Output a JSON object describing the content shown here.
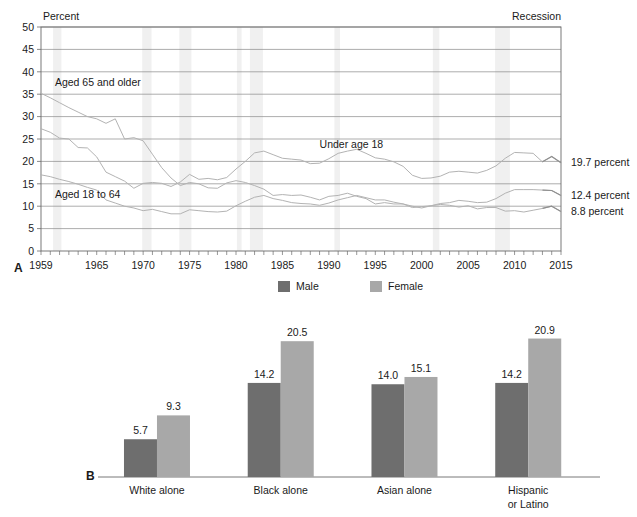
{
  "figure": {
    "panel_a_label": "A",
    "panel_b_label": "B"
  },
  "chart_data": [
    {
      "id": "panel_a",
      "type": "line",
      "title": "",
      "ylabel": "Percent",
      "xlabel": "",
      "ylim": [
        0,
        50
      ],
      "ytick_step": 5,
      "yticks": [
        "0",
        "5",
        "10",
        "15",
        "20",
        "25",
        "30",
        "35",
        "40",
        "45",
        "50"
      ],
      "xlim": [
        1959,
        2015
      ],
      "xticks": [
        "1959",
        "1965",
        "1970",
        "1975",
        "1980",
        "1985",
        "1990",
        "1995",
        "2000",
        "2005",
        "2010",
        "2015"
      ],
      "xtick_values": [
        1959,
        1965,
        1970,
        1975,
        1980,
        1985,
        1990,
        1995,
        2000,
        2005,
        2010,
        2015
      ],
      "grid": true,
      "legend_position": "inline-annotation",
      "recession_legend_label": "Recession",
      "recession_bands": [
        [
          1960.3,
          1961.2
        ],
        [
          1969.9,
          1970.9
        ],
        [
          1973.9,
          1975.2
        ],
        [
          1980.1,
          1980.6
        ],
        [
          1981.5,
          1982.9
        ],
        [
          1990.6,
          1991.2
        ],
        [
          2001.2,
          2001.9
        ],
        [
          2007.9,
          2009.5
        ]
      ],
      "annotations": [
        {
          "text": "Aged 65 and older",
          "x": 1960.5,
          "y": 36.8
        },
        {
          "text": "Under age 18",
          "x": 1989.0,
          "y": 23.0
        },
        {
          "text": "Aged 18 to 64",
          "x": 1960.5,
          "y": 11.8
        }
      ],
      "end_labels": [
        {
          "text": "19.7 percent",
          "value": 19.7
        },
        {
          "text": "12.4 percent",
          "value": 12.4
        },
        {
          "text": "8.8 percent",
          "value": 8.8
        }
      ],
      "series": [
        {
          "name": "Aged 65 and older",
          "end_value": 8.8,
          "x": [
            1959,
            1960,
            1961,
            1962,
            1963,
            1964,
            1965,
            1966,
            1967,
            1968,
            1969,
            1970,
            1971,
            1972,
            1973,
            1974,
            1975,
            1976,
            1977,
            1978,
            1979,
            1980,
            1981,
            1982,
            1983,
            1984,
            1985,
            1986,
            1987,
            1988,
            1989,
            1990,
            1991,
            1992,
            1993,
            1994,
            1995,
            1996,
            1997,
            1998,
            1999,
            2000,
            2001,
            2002,
            2003,
            2004,
            2005,
            2006,
            2007,
            2008,
            2009,
            2010,
            2011,
            2012,
            2013,
            2014,
            2015
          ],
          "values": [
            35.2,
            34.2,
            33.1,
            32.0,
            31.0,
            30.0,
            29.5,
            28.5,
            29.5,
            25.0,
            25.3,
            24.6,
            21.6,
            18.6,
            16.3,
            14.6,
            15.3,
            15.0,
            14.1,
            14.0,
            15.2,
            15.7,
            15.3,
            14.6,
            13.8,
            12.4,
            12.6,
            12.4,
            12.5,
            12.0,
            11.4,
            12.2,
            12.4,
            12.9,
            12.2,
            11.7,
            10.5,
            10.8,
            10.5,
            10.5,
            9.7,
            9.9,
            10.1,
            10.4,
            10.2,
            9.8,
            10.1,
            9.4,
            9.7,
            9.7,
            8.9,
            9.0,
            8.7,
            9.1,
            9.5,
            10.0,
            8.8
          ]
        },
        {
          "name": "Aged 18 to 64",
          "end_value": 12.4,
          "x": [
            1959,
            1960,
            1961,
            1962,
            1963,
            1964,
            1965,
            1966,
            1967,
            1968,
            1969,
            1970,
            1971,
            1972,
            1973,
            1974,
            1975,
            1976,
            1977,
            1978,
            1979,
            1980,
            1981,
            1982,
            1983,
            1984,
            1985,
            1986,
            1987,
            1988,
            1989,
            1990,
            1991,
            1992,
            1993,
            1994,
            1995,
            1996,
            1997,
            1998,
            1999,
            2000,
            2001,
            2002,
            2003,
            2004,
            2005,
            2006,
            2007,
            2008,
            2009,
            2010,
            2011,
            2012,
            2013,
            2014,
            2015
          ],
          "values": [
            17.0,
            16.6,
            16.0,
            15.5,
            14.9,
            14.2,
            13.6,
            11.4,
            10.7,
            10.0,
            9.6,
            9.0,
            9.3,
            8.8,
            8.3,
            8.3,
            9.2,
            9.0,
            8.8,
            8.7,
            8.9,
            10.1,
            11.1,
            12.0,
            12.4,
            11.7,
            11.3,
            10.8,
            10.6,
            10.5,
            10.2,
            10.7,
            11.4,
            11.9,
            12.4,
            11.9,
            11.4,
            11.4,
            10.9,
            10.5,
            10.0,
            9.6,
            10.1,
            10.6,
            10.8,
            11.3,
            11.1,
            10.8,
            10.9,
            11.7,
            12.9,
            13.7,
            13.7,
            13.7,
            13.6,
            13.5,
            12.4
          ]
        },
        {
          "name": "Under age 18",
          "end_value": 19.7,
          "x": [
            1959,
            1960,
            1961,
            1962,
            1963,
            1964,
            1965,
            1966,
            1967,
            1968,
            1969,
            1970,
            1971,
            1972,
            1973,
            1974,
            1975,
            1976,
            1977,
            1978,
            1979,
            1980,
            1981,
            1982,
            1983,
            1984,
            1985,
            1986,
            1987,
            1988,
            1989,
            1990,
            1991,
            1992,
            1993,
            1994,
            1995,
            1996,
            1997,
            1998,
            1999,
            2000,
            2001,
            2002,
            2003,
            2004,
            2005,
            2006,
            2007,
            2008,
            2009,
            2010,
            2011,
            2012,
            2013,
            2014,
            2015
          ],
          "values": [
            27.3,
            26.5,
            25.2,
            25.0,
            23.1,
            23.0,
            21.0,
            17.6,
            16.6,
            15.6,
            14.0,
            15.1,
            15.3,
            15.1,
            14.4,
            15.4,
            17.1,
            16.0,
            16.2,
            15.9,
            16.4,
            18.3,
            20.0,
            21.9,
            22.3,
            21.5,
            20.7,
            20.5,
            20.3,
            19.5,
            19.6,
            20.6,
            21.8,
            22.3,
            22.7,
            21.8,
            20.8,
            20.5,
            19.9,
            18.9,
            16.9,
            16.2,
            16.3,
            16.7,
            17.6,
            17.8,
            17.6,
            17.4,
            18.0,
            19.0,
            20.7,
            22.0,
            21.9,
            21.8,
            19.9,
            21.1,
            19.7
          ]
        }
      ]
    },
    {
      "id": "panel_b",
      "type": "bar",
      "title": "",
      "categories": [
        "White alone",
        "Black alone",
        "Asian alone",
        "Hispanic\nor Latino"
      ],
      "categories_flat": [
        "White alone",
        "Black alone",
        "Asian alone",
        "Hispanic or Latino"
      ],
      "series": [
        {
          "name": "Male",
          "values": [
            5.7,
            14.2,
            14.0,
            14.2
          ],
          "color": "#6e6e6e"
        },
        {
          "name": "Female",
          "values": [
            9.3,
            20.5,
            15.1,
            20.9
          ],
          "color": "#a8a8a8"
        }
      ],
      "ylim": [
        0,
        24
      ],
      "grid": false,
      "legend_position": "top-center",
      "legend": [
        "Male",
        "Female"
      ]
    }
  ],
  "colors": {
    "male_bar": "#6e6e6e",
    "female_bar": "#a8a8a8",
    "grid_line": "#8a8a8a",
    "axis_line": "#6a6a6a",
    "series_line": "#b3b3b3",
    "series_line_dark": "#8f8f8f",
    "recession_band": "#f0f0f0",
    "text": "#1a1a1a"
  }
}
